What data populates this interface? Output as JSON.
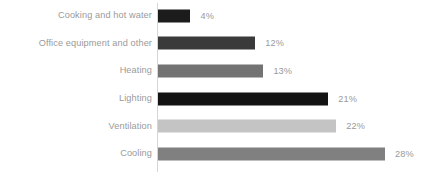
{
  "chart_data": {
    "type": "bar",
    "orientation": "horizontal",
    "title": "",
    "subtitle": "",
    "xlabel": "",
    "ylabel": "",
    "xlim": [
      0,
      28
    ],
    "grid": false,
    "legend": false,
    "legend_position": "none",
    "value_suffix": "%",
    "categories": [
      "Cooking and hot water",
      "Office equipment and other",
      "Heating",
      "Lighting",
      "Ventilation",
      "Cooling"
    ],
    "values": [
      4,
      12,
      13,
      21,
      22,
      28
    ],
    "value_labels": [
      "4%",
      "12%",
      "13%",
      "21%",
      "22%",
      "28%"
    ],
    "bar_colors": [
      "#1c1c1c",
      "#3a3a3a",
      "#737373",
      "#131313",
      "#c4c4c4",
      "#808080"
    ],
    "bars": [
      {
        "label": "Cooking and hot water",
        "value": 4,
        "value_label": "4%",
        "color": "#1c1c1c"
      },
      {
        "label": "Office equipment and other",
        "value": 12,
        "value_label": "12%",
        "color": "#3a3a3a"
      },
      {
        "label": "Heating",
        "value": 13,
        "value_label": "13%",
        "color": "#737373"
      },
      {
        "label": "Lighting",
        "value": 21,
        "value_label": "21%",
        "color": "#131313"
      },
      {
        "label": "Ventilation",
        "value": 22,
        "value_label": "22%",
        "color": "#c4c4c4"
      },
      {
        "label": "Cooling",
        "value": 28,
        "value_label": "28%",
        "color": "#808080"
      }
    ],
    "axis": {
      "baseline_color": "#d6d6d6",
      "tick_labels": [],
      "show_y_axis_line": true,
      "show_x_axis_line": false
    },
    "style": {
      "background": "#ffffff",
      "label_color": "#9a9a9a",
      "value_color": "#9a9a9a"
    }
  }
}
